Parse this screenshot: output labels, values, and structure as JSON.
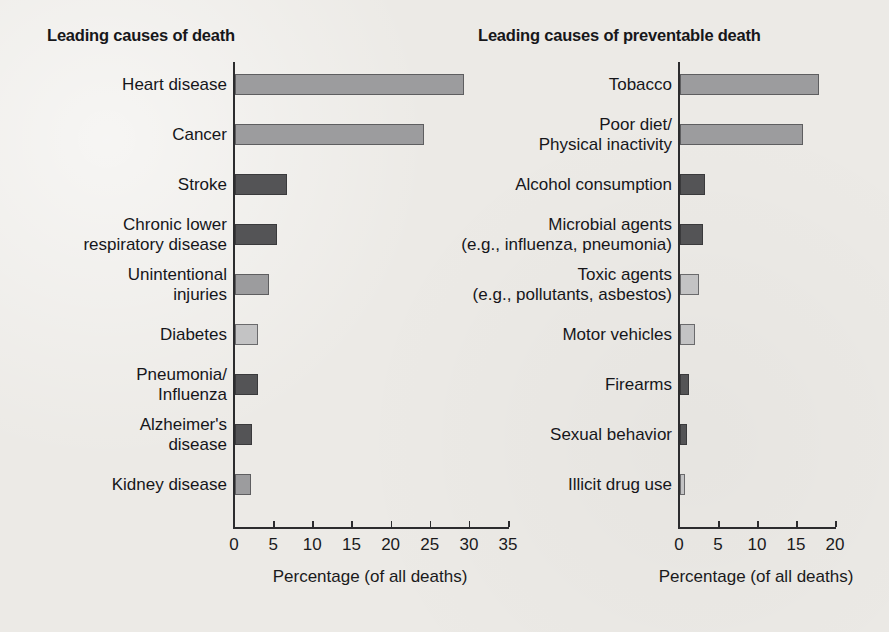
{
  "figure": {
    "background_color": "#eceae6",
    "axis_color": "#2c2c2e"
  },
  "charts": [
    {
      "id": "leading-causes-of-death",
      "title": "Leading causes of death",
      "xlabel": "Percentage (of all deaths)",
      "xticks": [
        "0",
        "5",
        "10",
        "15",
        "20",
        "25",
        "30",
        "35"
      ],
      "xlim_max": 35,
      "bars": [
        {
          "label": "Heart disease",
          "label_lines": [
            "Heart disease"
          ],
          "value": 29.3,
          "shade": "medium",
          "color": "#9c9c9e"
        },
        {
          "label": "Cancer",
          "label_lines": [
            "Cancer"
          ],
          "value": 24.1,
          "shade": "medium",
          "color": "#9c9c9e"
        },
        {
          "label": "Stroke",
          "label_lines": [
            "Stroke"
          ],
          "value": 6.7,
          "shade": "dark",
          "color": "#545456"
        },
        {
          "label": "Chronic lower respiratory disease",
          "label_lines": [
            "Chronic lower",
            "respiratory disease"
          ],
          "value": 5.4,
          "shade": "dark",
          "color": "#545456"
        },
        {
          "label": "Unintentional injuries",
          "label_lines": [
            "Unintentional",
            "injuries"
          ],
          "value": 4.4,
          "shade": "medium",
          "color": "#9c9c9e"
        },
        {
          "label": "Diabetes",
          "label_lines": [
            "Diabetes"
          ],
          "value": 3.0,
          "shade": "light",
          "color": "#c3c3c4"
        },
        {
          "label": "Pneumonia/Influenza",
          "label_lines": [
            "Pneumonia/",
            "Influenza"
          ],
          "value": 2.9,
          "shade": "dark",
          "color": "#545456"
        },
        {
          "label": "Alzheimer's disease",
          "label_lines": [
            "Alzheimer's",
            "disease"
          ],
          "value": 2.2,
          "shade": "dark",
          "color": "#545456"
        },
        {
          "label": "Kidney disease",
          "label_lines": [
            "Kidney disease"
          ],
          "value": 2.1,
          "shade": "medium",
          "color": "#9c9c9e"
        }
      ]
    },
    {
      "id": "leading-causes-of-preventable-death",
      "title": "Leading causes of preventable death",
      "xlabel": "Percentage (of all deaths)",
      "xticks": [
        "0",
        "5",
        "10",
        "15",
        "20"
      ],
      "xlim_max": 20,
      "bars": [
        {
          "label": "Tobacco",
          "label_lines": [
            "Tobacco"
          ],
          "value": 17.8,
          "shade": "medium",
          "color": "#9c9c9e"
        },
        {
          "label": "Poor diet/Physical inactivity",
          "label_lines": [
            "Poor diet/",
            "Physical inactivity"
          ],
          "value": 15.8,
          "shade": "medium",
          "color": "#9c9c9e"
        },
        {
          "label": "Alcohol consumption",
          "label_lines": [
            "Alcohol consumption"
          ],
          "value": 3.2,
          "shade": "dark",
          "color": "#545456"
        },
        {
          "label": "Microbial agents (e.g., influenza, pneumonia)",
          "label_lines": [
            "Microbial agents",
            "(e.g., influenza, pneumonia)"
          ],
          "value": 3.0,
          "shade": "dark",
          "color": "#545456"
        },
        {
          "label": "Toxic agents (e.g., pollutants, asbestos)",
          "label_lines": [
            "Toxic agents",
            "(e.g., pollutants, asbestos)"
          ],
          "value": 2.4,
          "shade": "light",
          "color": "#c3c3c4"
        },
        {
          "label": "Motor vehicles",
          "label_lines": [
            "Motor vehicles"
          ],
          "value": 1.9,
          "shade": "light",
          "color": "#c3c3c4"
        },
        {
          "label": "Firearms",
          "label_lines": [
            "Firearms"
          ],
          "value": 1.1,
          "shade": "dark",
          "color": "#545456"
        },
        {
          "label": "Sexual behavior",
          "label_lines": [
            "Sexual behavior"
          ],
          "value": 0.9,
          "shade": "dark",
          "color": "#545456"
        },
        {
          "label": "Illicit drug use",
          "label_lines": [
            "Illicit drug use"
          ],
          "value": 0.6,
          "shade": "light",
          "color": "#c3c3c4"
        }
      ]
    }
  ],
  "chart_data": [
    {
      "type": "bar",
      "orientation": "horizontal",
      "title": "Leading causes of death",
      "xlabel": "Percentage (of all deaths)",
      "ylabel": "",
      "xlim": [
        0,
        35
      ],
      "xticks": [
        0,
        5,
        10,
        15,
        20,
        25,
        30,
        35
      ],
      "grid": false,
      "legend": "none",
      "categories": [
        "Heart disease",
        "Cancer",
        "Stroke",
        "Chronic lower respiratory disease",
        "Unintentional injuries",
        "Diabetes",
        "Pneumonia/Influenza",
        "Alzheimer's disease",
        "Kidney disease"
      ],
      "values": [
        29.3,
        24.1,
        6.7,
        5.4,
        4.4,
        3.0,
        2.9,
        2.2,
        2.1
      ]
    },
    {
      "type": "bar",
      "orientation": "horizontal",
      "title": "Leading causes of preventable death",
      "xlabel": "Percentage (of all deaths)",
      "ylabel": "",
      "xlim": [
        0,
        20
      ],
      "xticks": [
        0,
        5,
        10,
        15,
        20
      ],
      "grid": false,
      "legend": "none",
      "categories": [
        "Tobacco",
        "Poor diet/Physical inactivity",
        "Alcohol consumption",
        "Microbial agents (e.g., influenza, pneumonia)",
        "Toxic agents (e.g., pollutants, asbestos)",
        "Motor vehicles",
        "Firearms",
        "Sexual behavior",
        "Illicit drug use"
      ],
      "values": [
        17.8,
        15.8,
        3.2,
        3.0,
        2.4,
        1.9,
        1.1,
        0.9,
        0.6
      ]
    }
  ]
}
